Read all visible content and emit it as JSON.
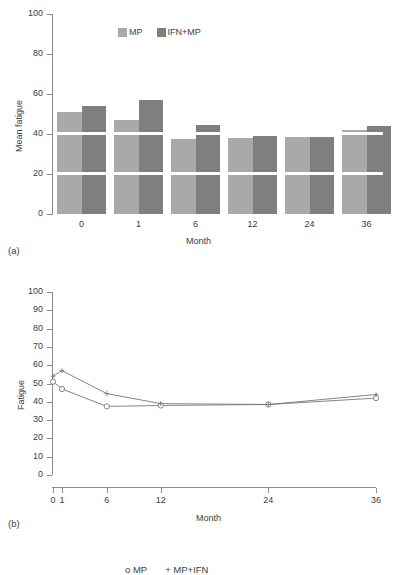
{
  "figure": {
    "panel_a_tag": "(a)",
    "panel_b_tag": "(b)",
    "caption_fragment": ""
  },
  "chart_data": [
    {
      "type": "bar",
      "panel": "(a)",
      "title": "",
      "xlabel": "Month",
      "ylabel": "Mean fatigue",
      "categories": [
        "0",
        "1",
        "6",
        "12",
        "24",
        "36"
      ],
      "ylim": [
        0,
        100
      ],
      "yticks": [
        0,
        20,
        40,
        60,
        80,
        100
      ],
      "grid": "white horizontal bands at 20 and 40",
      "legend_position": "top-center",
      "series": [
        {
          "name": "MP",
          "color": "#a9a9a9",
          "values": [
            51,
            47,
            37.5,
            38,
            38.5,
            42
          ]
        },
        {
          "name": "IFN+MP",
          "color": "#7f7f7f",
          "values": [
            54,
            57,
            44.5,
            39,
            38.5,
            44
          ]
        }
      ]
    },
    {
      "type": "line",
      "panel": "(b)",
      "title": "",
      "xlabel": "Month",
      "ylabel": "Fatigue",
      "x": [
        0,
        1,
        6,
        12,
        24,
        36
      ],
      "xticklabels": [
        "0",
        "1",
        "6",
        "12",
        "24",
        "36"
      ],
      "xlim": [
        0,
        36
      ],
      "ylim": [
        0,
        100
      ],
      "yticks": [
        0,
        10,
        20,
        30,
        40,
        50,
        60,
        70,
        80,
        90,
        100
      ],
      "grid": false,
      "legend_position": "top-center",
      "legend_entries": [
        "o MP",
        "+ MP+IFN"
      ],
      "series": [
        {
          "name": "MP",
          "marker": "o",
          "color": "#777777",
          "values": [
            51,
            47,
            37.5,
            38,
            38.5,
            42
          ]
        },
        {
          "name": "MP+IFN",
          "marker": "+",
          "color": "#777777",
          "values": [
            54,
            57,
            44.5,
            39,
            38.5,
            44
          ]
        }
      ]
    }
  ],
  "panel_a": {
    "ylabel": "Mean fatigue",
    "xlabel": "Month",
    "yticks": [
      "0",
      "20",
      "40",
      "60",
      "80",
      "100"
    ],
    "xticks": [
      "0",
      "1",
      "6",
      "12",
      "24",
      "36"
    ],
    "legend": [
      {
        "label": "MP",
        "color": "#a9a9a9"
      },
      {
        "label": "IFN+MP",
        "color": "#7f7f7f"
      }
    ]
  },
  "panel_b": {
    "ylabel": "Fatigue",
    "xlabel": "Month",
    "yticks": [
      "0",
      "10",
      "20",
      "30",
      "40",
      "50",
      "60",
      "70",
      "80",
      "90",
      "100"
    ],
    "xticks": [
      "0",
      "1",
      "6",
      "12",
      "24",
      "36"
    ],
    "legend": [
      {
        "label": "o MP"
      },
      {
        "label": "+ MP+IFN"
      }
    ]
  }
}
